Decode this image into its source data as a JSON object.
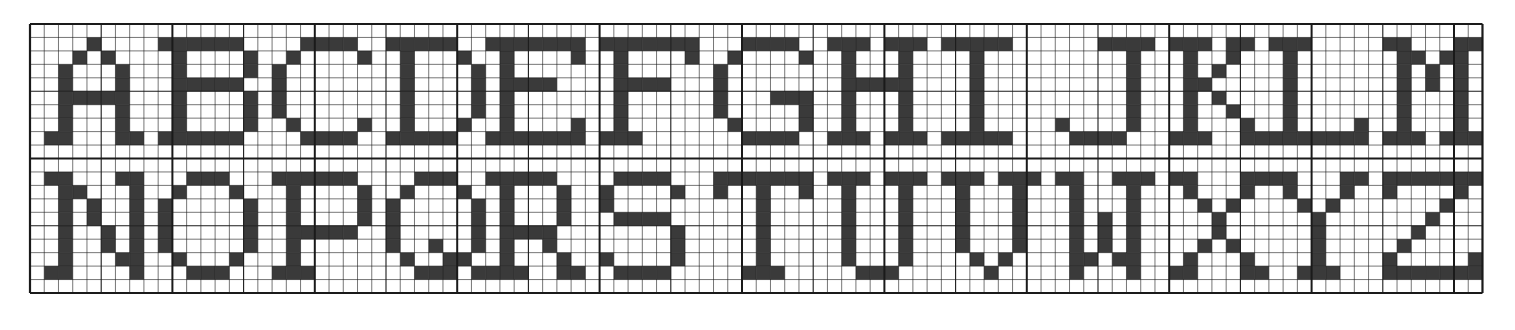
{
  "grid": {
    "origin_x": 30,
    "origin_y": 24,
    "cols": 102,
    "rows": 20,
    "cell_w": 14.24,
    "cell_h": 13.45,
    "major_every": 10,
    "minor_every": 5,
    "line_color": "#1a1a1a",
    "fill_color": "#3a3a3a",
    "background": "#ffffff"
  },
  "rows": [
    {
      "letters": [
        "A",
        "B",
        "C",
        "D",
        "E",
        "F",
        "G",
        "H",
        "I",
        "J",
        "K",
        "L",
        "M"
      ],
      "row_offset": 0
    },
    {
      "letters": [
        "N",
        "O",
        "P",
        "Q",
        "R",
        "S",
        "T",
        "U",
        "V",
        "W",
        "X",
        "Y",
        "Z"
      ],
      "row_offset": 10
    }
  ],
  "letter_pitch": 7.85,
  "glyphs": {
    "A": [
      "...X....",
      "..X.X...",
      ".X...X..",
      ".X...X..",
      ".XXXXX..",
      ".X...X..",
      ".X...X..",
      "XX...XX."
    ],
    "B": [
      "XXXXXX..",
      ".X....X.",
      ".X....X.",
      ".XXXXX..",
      ".X....X.",
      ".X....X.",
      ".X....X.",
      "XXXXXX.."
    ],
    "C": [
      "..XXXX..",
      ".X....X.",
      "X.......",
      "X.......",
      "X.......",
      "X.......",
      ".X....X.",
      "..XXXX.."
    ],
    "D": [
      "XXXXX...",
      ".X...X..",
      ".X....X.",
      ".X....X.",
      ".X....X.",
      ".X....X.",
      ".X...X..",
      "XXXXX..."
    ],
    "E": [
      "XXXXXXX.",
      ".X....X.",
      ".X......",
      ".XXXX...",
      ".X......",
      ".X......",
      ".X....X.",
      "XXXXXXX."
    ],
    "F": [
      "XXXXXXX.",
      ".X....X.",
      ".X......",
      ".XXXX...",
      ".X......",
      ".X......",
      ".X......",
      "XXX....."
    ],
    "G": [
      "..XXXX..",
      ".X....X.",
      "X.......",
      "X.......",
      "X...XXX.",
      "X.....X.",
      ".X....X.",
      "..XXXX.."
    ],
    "H": [
      "XXX.XXX.",
      ".X...X..",
      ".X...X..",
      ".XXXXX..",
      ".X...X..",
      ".X...X..",
      ".X...X..",
      "XXX.XXX."
    ],
    "I": [
      "XXXXX...",
      "..X.....",
      "..X.....",
      "..X.....",
      "..X.....",
      "..X.....",
      "..X.....",
      "XXXXX..."
    ],
    "J": [
      "...XXXX.",
      ".....X..",
      ".....X..",
      ".....X..",
      ".....X..",
      ".....X..",
      "X....X..",
      ".XXXX..."
    ],
    "K": [
      "XXX.XX..",
      ".X..X...",
      ".X.X....",
      ".XX.....",
      ".X.X....",
      ".X..X...",
      ".X...X..",
      "XXX..XX."
    ],
    "L": [
      "XXX.....",
      ".X......",
      ".X......",
      ".X......",
      ".X......",
      ".X......",
      ".X....X.",
      "XXXXXXX."
    ],
    "M": [
      "XX...XX.",
      ".XX.XX..",
      ".X.X.X..",
      ".X.X.X..",
      ".X...X..",
      ".X...X..",
      ".X...X..",
      "XXX.XXX."
    ],
    "N": [
      "XX...XX.",
      ".XX...X.",
      ".X.X..X.",
      ".X.X..X.",
      ".X..X.X.",
      ".X..X.X.",
      ".X...XX.",
      "XX....X."
    ],
    "O": [
      "..XXX...",
      ".X...X..",
      "X.....X.",
      "X.....X.",
      "X.....X.",
      "X.....X.",
      ".X...X..",
      "..XXX..."
    ],
    "P": [
      "XXXXXX..",
      ".X....X.",
      ".X....X.",
      ".X....X.",
      ".XXXXX..",
      ".X......",
      ".X......",
      "XXX....."
    ],
    "Q": [
      "..XXX...",
      ".X...X..",
      "X.....X.",
      "X.....X.",
      "X.....X.",
      "X..X..X.",
      ".X..XX..",
      "..XXX.X."
    ],
    "R": [
      "XXXXX...",
      ".X...X..",
      ".X...X..",
      ".X...X..",
      ".XXXX...",
      ".X..X...",
      ".X...X..",
      "XXX..XX."
    ],
    "S": [
      ".XXXX...",
      "X....X..",
      "X.......",
      ".XXXX...",
      ".....X..",
      ".....X..",
      "X....X..",
      ".XXXX..."
    ],
    "T": [
      "XXXXXXX.",
      "X..X..X.",
      "...X....",
      "...X....",
      "...X....",
      "...X....",
      "...X....",
      "..XXX..."
    ],
    "U": [
      "XXX.XXX.",
      ".X...X..",
      ".X...X..",
      ".X...X..",
      ".X...X..",
      ".X...X..",
      ".X...X..",
      "..XXX..."
    ],
    "V": [
      "XXX.XXX.",
      ".X...X..",
      ".X...X..",
      ".X...X..",
      ".X...X..",
      ".X...X..",
      "..X.X...",
      "...X...."
    ],
    "W": [
      "XX..XXX.",
      ".X...X..",
      ".X...X..",
      ".X.X.X..",
      ".X.X.X..",
      ".X.X.X..",
      ".XX.XX..",
      ".X...X.."
    ],
    "X": [
      "XX...XX.",
      ".X...X..",
      "..X.X...",
      "...X....",
      "...X....",
      "..X.X...",
      ".X...X..",
      "XX...XX."
    ],
    "Y": [
      "XX...XX.",
      ".X...X..",
      "..X.X...",
      "...X....",
      "...X....",
      "...X....",
      "...X....",
      "..XXX..."
    ],
    "Z": [
      "XXXXXXX.",
      "X....X..",
      "....X...",
      "...X....",
      "..X.....",
      ".X......",
      "X.....X.",
      "XXXXXXX."
    ]
  }
}
